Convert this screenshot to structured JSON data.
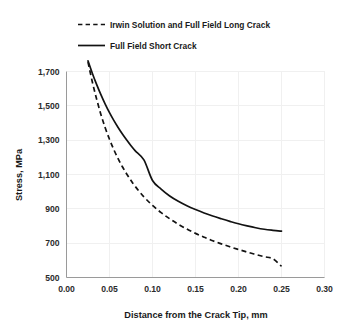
{
  "chart_data": {
    "type": "line",
    "title": "",
    "xlabel": "Distance from the Crack Tip, mm",
    "ylabel": "Stress, MPa",
    "xlim": [
      0.0,
      0.3
    ],
    "ylim": [
      500,
      1700
    ],
    "xticks": [
      "0.00",
      "0.05",
      "0.10",
      "0.15",
      "0.20",
      "0.25",
      "0.30"
    ],
    "xtick_values": [
      0.0,
      0.05,
      0.1,
      0.15,
      0.2,
      0.25,
      0.3
    ],
    "yticks": [
      "500",
      "700",
      "900",
      "1,100",
      "1,300",
      "1,500",
      "1,700"
    ],
    "ytick_values": [
      500,
      700,
      900,
      1100,
      1300,
      1500,
      1700
    ],
    "grid": true,
    "legend_position": "top",
    "series": [
      {
        "name": "Irwin Solution and Full Field Long Crack",
        "style": "dashed",
        "color": "#121212",
        "x": [
          0.025,
          0.03,
          0.035,
          0.04,
          0.045,
          0.05,
          0.055,
          0.06,
          0.065,
          0.07,
          0.075,
          0.08,
          0.09,
          0.1,
          0.11,
          0.12,
          0.13,
          0.14,
          0.15,
          0.16,
          0.17,
          0.18,
          0.19,
          0.2,
          0.21,
          0.22,
          0.23,
          0.24,
          0.25
        ],
        "values": [
          1755,
          1640,
          1540,
          1450,
          1372,
          1305,
          1245,
          1192,
          1145,
          1103,
          1065,
          1030,
          970,
          920,
          878,
          842,
          810,
          782,
          757,
          735,
          714,
          696,
          679,
          663,
          648,
          634,
          621,
          609,
          565
        ]
      },
      {
        "name": "Full Field Short Crack",
        "style": "solid",
        "color": "#121212",
        "x": [
          0.025,
          0.03,
          0.035,
          0.04,
          0.045,
          0.05,
          0.055,
          0.06,
          0.065,
          0.07,
          0.075,
          0.08,
          0.09,
          0.1,
          0.11,
          0.12,
          0.13,
          0.14,
          0.15,
          0.16,
          0.17,
          0.18,
          0.19,
          0.2,
          0.21,
          0.22,
          0.23,
          0.24,
          0.25
        ],
        "values": [
          1762,
          1690,
          1625,
          1565,
          1510,
          1460,
          1415,
          1374,
          1336,
          1301,
          1268,
          1238,
          1185,
          1065,
          1015,
          975,
          944,
          918,
          896,
          876,
          858,
          842,
          827,
          813,
          801,
          790,
          781,
          775,
          770
        ]
      }
    ]
  },
  "legend": {
    "items": [
      {
        "label": "Irwin Solution and Full Field Long Crack",
        "style": "dashed"
      },
      {
        "label": "Full Field Short Crack",
        "style": "solid"
      }
    ]
  }
}
